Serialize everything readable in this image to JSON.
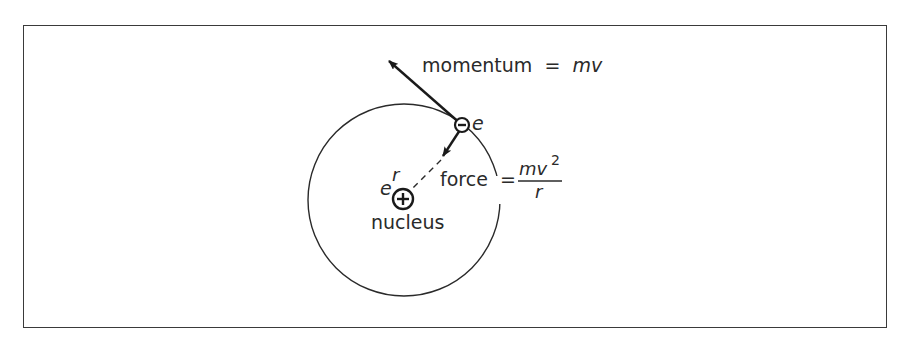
{
  "diagram": {
    "title": "",
    "labels": {
      "momentum_word": "momentum",
      "equals": "=",
      "momentum_expr": "mv",
      "electron_charge": "e",
      "force_word": "force",
      "force_numerator": "mv",
      "force_numerator_exp": "2",
      "force_denominator": "r",
      "radius": "r",
      "nucleus_charge": "e",
      "nucleus": "nucleus"
    },
    "elements": {
      "orbit": {
        "shape": "circle",
        "cx": 404,
        "cy": 200,
        "r": 96
      },
      "nucleus": {
        "cx": 403,
        "cy": 199,
        "r": 10,
        "sign": "+"
      },
      "electron": {
        "cx": 462,
        "cy": 125,
        "r": 7,
        "sign": "-"
      },
      "momentum_vector": {
        "from": [
          462,
          125
        ],
        "to": [
          388,
          60
        ],
        "label": "momentum = mv"
      },
      "force_vector": {
        "from": [
          462,
          125
        ],
        "to": [
          442,
          157
        ],
        "label": "force = mv²/r"
      },
      "radius_line": {
        "from": [
          442,
          157
        ],
        "to": [
          403,
          199
        ],
        "style": "dashed"
      }
    },
    "colors": {
      "ink": "#2a2a2a",
      "background": "#ffffff",
      "frame": "#3a3a3a"
    }
  }
}
